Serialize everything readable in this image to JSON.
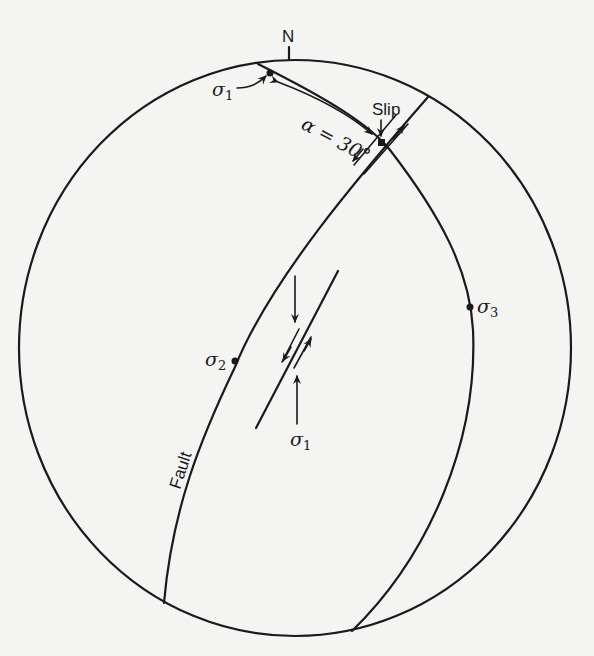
{
  "diagram": {
    "type": "stereographic projection (stereonet) of fault and principal stresses",
    "north_label": "N",
    "labels": {
      "slip": "Slip",
      "angle": "α = 30°",
      "fault": "Fault",
      "sigma1_top": "σ",
      "sigma1_top_sub": "1",
      "sigma1_center": "σ",
      "sigma1_center_sub": "1",
      "sigma2": "σ",
      "sigma2_sub": "2",
      "sigma3": "σ",
      "sigma3_sub": "3"
    },
    "points": [
      {
        "name": "sigma1",
        "note": "on primitive circle near N"
      },
      {
        "name": "slip",
        "note": "intersection of fault and σ1-σ3 plane"
      },
      {
        "name": "sigma2",
        "note": "on fault great circle"
      },
      {
        "name": "sigma3",
        "note": "on σ1-σ3 great circle"
      }
    ],
    "colors": {
      "background": "#f4f4f2",
      "ink": "#1a1a1a"
    }
  }
}
